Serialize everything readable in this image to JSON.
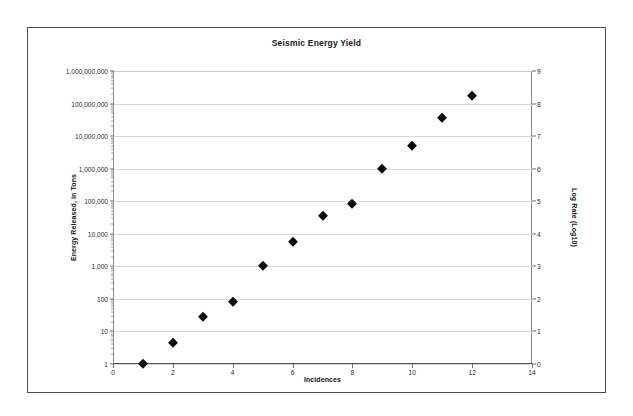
{
  "chart_data": {
    "type": "scatter",
    "title": "Seismic Energy Yield",
    "xlabel": "Incidences",
    "ylabel": "Energy Released, in Tons",
    "y2label": "Log Rate (Log10)",
    "grid": true,
    "legend": false,
    "yscale": "log",
    "ylim": [
      1,
      1000000000
    ],
    "y2lim": [
      0,
      9
    ],
    "xlim": [
      0,
      14
    ],
    "xticks": [
      0,
      2,
      4,
      6,
      8,
      10,
      12,
      14
    ],
    "xticklabels": [
      "0",
      "2",
      "4",
      "6",
      "8",
      "10",
      "12",
      "14"
    ],
    "yticks": [
      1,
      10,
      100,
      1000,
      10000,
      100000,
      1000000,
      10000000,
      100000000,
      1000000000
    ],
    "yticklabels": [
      "1",
      "10",
      "100",
      "1,000",
      "10,000",
      "100,000",
      "1,000,000",
      "10,000,000",
      "100,000,000",
      "1,000,000,000"
    ],
    "y2ticks": [
      0,
      1,
      2,
      3,
      4,
      5,
      6,
      7,
      8,
      9
    ],
    "y2ticklabels": [
      "0",
      "1",
      "2",
      "3",
      "4",
      "5",
      "6",
      "7",
      "8",
      "9"
    ],
    "marker": "diamond",
    "marker_color": "#0a0a0a",
    "x": [
      1,
      2,
      3,
      4,
      5,
      6,
      7,
      8,
      9,
      10,
      11,
      12
    ],
    "values": [
      1,
      4.5,
      28,
      80,
      1000,
      5500,
      35000,
      85000,
      1000000,
      5000000,
      35000000,
      170000000
    ],
    "log_values": [
      0,
      0.65,
      1.45,
      1.9,
      3,
      3.74,
      4.54,
      4.93,
      6,
      6.7,
      7.54,
      8.23
    ]
  }
}
